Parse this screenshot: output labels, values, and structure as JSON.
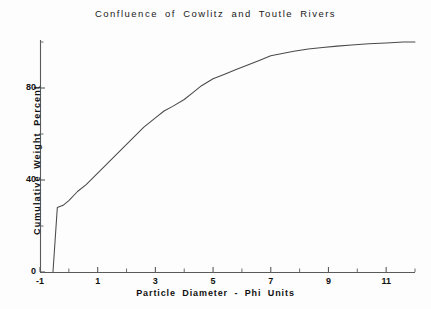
{
  "chart_data": {
    "type": "line",
    "title": "Confluence of Cowlitz and Toutle Rivers",
    "xlabel": "Particle Diameter - Phi Units",
    "ylabel": "Cumulative Weight Percent",
    "xlim": [
      -1,
      12
    ],
    "ylim": [
      0,
      104
    ],
    "grid": false,
    "legend": null,
    "x_ticks_major": [
      -1,
      1,
      3,
      5,
      7,
      9,
      11
    ],
    "x_tick_labels": [
      "-1",
      "1",
      "3",
      "5",
      "7",
      "9",
      "11"
    ],
    "x_ticks_minor": [
      0,
      2,
      4,
      6,
      8,
      10,
      12
    ],
    "y_ticks_major": [
      0,
      40,
      80
    ],
    "y_tick_labels": [
      "0",
      "40",
      "80"
    ],
    "y_ticks_minor": [
      20,
      60,
      100
    ],
    "series": [
      {
        "name": "Cumulative Weight Percent",
        "x": [
          -0.55,
          -0.4,
          -0.2,
          0.0,
          0.3,
          0.6,
          1.0,
          1.4,
          1.8,
          2.2,
          2.6,
          3.0,
          3.3,
          3.6,
          4.0,
          4.3,
          4.6,
          5.0,
          5.4,
          5.8,
          6.2,
          6.6,
          7.0,
          7.4,
          7.8,
          8.3,
          8.8,
          9.3,
          9.8,
          10.4,
          11.0,
          11.6,
          12.0
        ],
        "y": [
          0,
          28,
          29,
          31,
          35,
          38,
          43,
          48,
          53,
          58,
          63,
          67,
          70,
          72,
          75,
          78,
          81,
          84,
          86,
          88,
          90,
          92,
          94,
          95,
          96,
          97,
          97.6,
          98.2,
          98.7,
          99.2,
          99.6,
          100,
          100
        ]
      }
    ]
  },
  "axes": {
    "origin_label": "0"
  }
}
